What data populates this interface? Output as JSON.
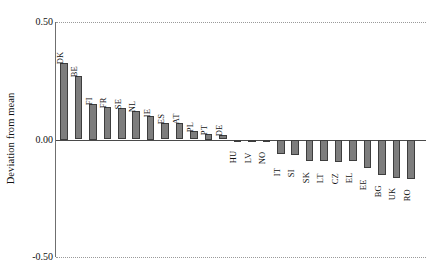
{
  "chart_data": {
    "type": "bar",
    "title": "",
    "subtitle": "",
    "xlabel": "",
    "ylabel": "Deviation from mean",
    "ylim": [
      -0.5,
      0.5
    ],
    "ytick_labels": [
      "0.50",
      "0.00",
      "-0.50"
    ],
    "ytick_values": [
      0.5,
      0.0,
      -0.5
    ],
    "grid": "dotted horizontal gridlines at 0.50 and -0.50 only",
    "legend": "none",
    "bar_color": "#7d7d7d",
    "bar_edge_color": "#3d3d3d",
    "categories": [
      "DK",
      "BE",
      "FI",
      "FR",
      "SE",
      "NL",
      "IE",
      "ES",
      "AT",
      "PL",
      "PT",
      "DE",
      "HU",
      "LV",
      "NO",
      "IT",
      "SI",
      "SK",
      "LT",
      "CZ",
      "EL",
      "EE",
      "BG",
      "UK",
      "RO"
    ],
    "values": [
      0.325,
      0.27,
      0.15,
      0.14,
      0.132,
      0.12,
      0.1,
      0.072,
      0.07,
      0.038,
      0.025,
      0.02,
      -0.008,
      -0.008,
      -0.01,
      -0.06,
      -0.065,
      -0.09,
      -0.092,
      -0.097,
      -0.09,
      -0.12,
      -0.15,
      -0.165,
      -0.168
    ]
  }
}
